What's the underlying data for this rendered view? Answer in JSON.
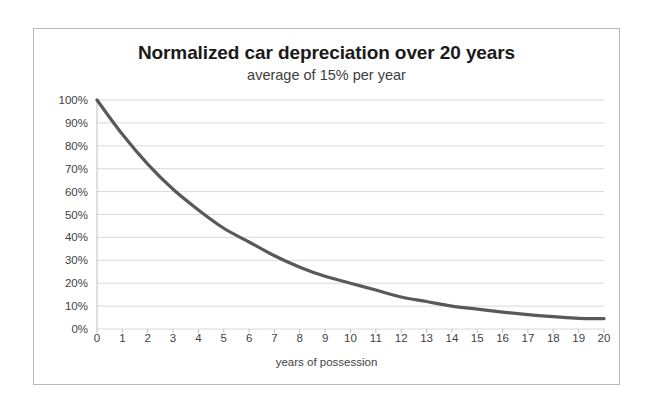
{
  "chart_data": {
    "type": "line",
    "title": "Normalized car depreciation over 20 years",
    "subtitle": "average of 15% per year",
    "xlabel": "years of possession",
    "ylabel": "",
    "xlim": [
      0,
      20
    ],
    "ylim": [
      0,
      1
    ],
    "grid": "horizontal",
    "legend": "none",
    "line_color": "#595959",
    "categories": [
      0,
      1,
      2,
      3,
      4,
      5,
      6,
      7,
      8,
      9,
      10,
      11,
      12,
      13,
      14,
      15,
      16,
      17,
      18,
      19,
      20
    ],
    "values": [
      1.0,
      0.85,
      0.72,
      0.61,
      0.52,
      0.44,
      0.38,
      0.32,
      0.27,
      0.23,
      0.2,
      0.17,
      0.14,
      0.12,
      0.1,
      0.087,
      0.074,
      0.063,
      0.054,
      0.046,
      0.045
    ],
    "x_tick_labels": [
      "0",
      "1",
      "2",
      "3",
      "4",
      "5",
      "6",
      "7",
      "8",
      "9",
      "10",
      "11",
      "12",
      "13",
      "14",
      "15",
      "16",
      "17",
      "18",
      "19",
      "20"
    ],
    "y_tick_values": [
      0,
      0.1,
      0.2,
      0.3,
      0.4,
      0.5,
      0.6,
      0.7,
      0.8,
      0.9,
      1.0
    ],
    "y_tick_labels": [
      "0%",
      "10%",
      "20%",
      "30%",
      "40%",
      "50%",
      "60%",
      "70%",
      "80%",
      "90%",
      "100%"
    ]
  },
  "colors": {
    "line": "#595959",
    "gridline": "#d9d9d9",
    "axis": "#bfbfbf",
    "border": "#b9b9b9",
    "title_text": "#1a1a1a",
    "tick_text": "#3f3f3f"
  }
}
